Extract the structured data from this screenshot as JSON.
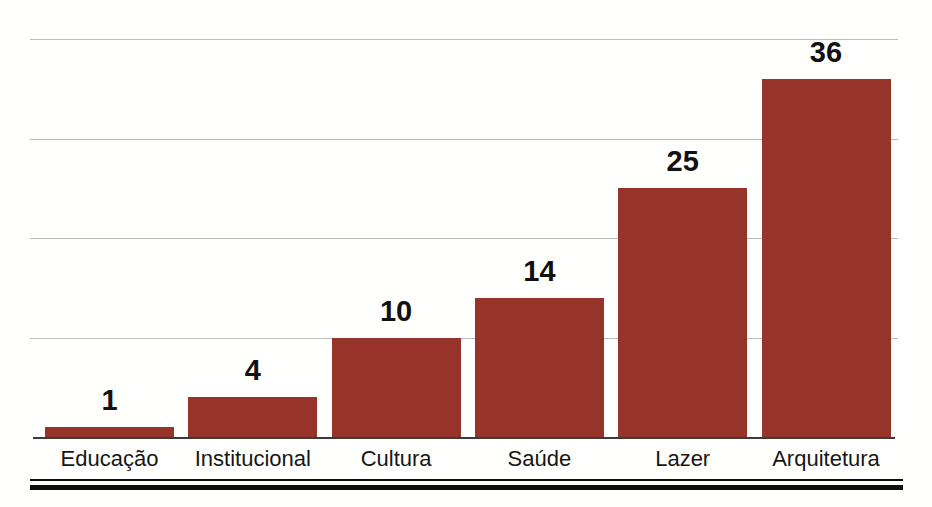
{
  "chart_data": {
    "type": "bar",
    "categories": [
      "Educação",
      "Institucional",
      "Cultura",
      "Saúde",
      "Lazer",
      "Arquitetura"
    ],
    "values": [
      1,
      4,
      10,
      14,
      25,
      36
    ],
    "value_labels": [
      "1",
      "4",
      "10",
      "14",
      "25",
      "36"
    ],
    "title": "",
    "xlabel": "",
    "ylabel": "",
    "ylim": [
      0,
      40
    ],
    "gridline_values": [
      10,
      20,
      30,
      40
    ],
    "grid": "horizontal-only",
    "legend_position": "none",
    "bar_color": "#96342a",
    "gridline_color": "#bcbcbc",
    "axis_color": "#3b3b3b",
    "label_color": "#161616",
    "value_label_color": "#111111",
    "background_color": "#fffffe",
    "bottom_rule_color": "#0d0d0d"
  }
}
